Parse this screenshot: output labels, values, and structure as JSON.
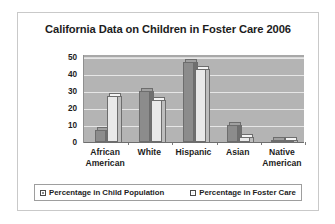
{
  "card": {
    "title": "California Data on Children in Foster Care 2006"
  },
  "legend": {
    "items": [
      {
        "label": "Percentage in Child Population",
        "swatch": "dark-gray-swatch-icon",
        "color": "#8c8c8c"
      },
      {
        "label": "Percentage in Foster Care",
        "swatch": "light-gray-swatch-icon",
        "color": "#f2f2f2"
      }
    ]
  },
  "axis": {
    "y_ticks": [
      "0",
      "10",
      "20",
      "30",
      "40",
      "50"
    ]
  },
  "categories_display": [
    {
      "line1": "African",
      "line2": "American"
    },
    {
      "line1": "White",
      "line2": ""
    },
    {
      "line1": "Hispanic",
      "line2": ""
    },
    {
      "line1": "Asian",
      "line2": ""
    },
    {
      "line1": "Native",
      "line2": "American"
    }
  ],
  "chart_data": {
    "type": "bar",
    "title": "California Data on Children in Foster Care 2006",
    "xlabel": "",
    "ylabel": "",
    "ylim": [
      0,
      50
    ],
    "yticks": [
      0,
      10,
      20,
      30,
      40,
      50
    ],
    "grid": true,
    "legend_position": "bottom",
    "categories": [
      "African American",
      "White",
      "Hispanic",
      "Asian",
      "Native American"
    ],
    "series": [
      {
        "name": "Percentage in Child Population",
        "color": "#8c8c8c",
        "values": [
          7,
          30,
          47,
          10,
          1
        ]
      },
      {
        "name": "Percentage in Foster Care",
        "color": "#e9e9e9",
        "values": [
          27,
          25,
          43,
          3,
          1
        ]
      }
    ]
  }
}
